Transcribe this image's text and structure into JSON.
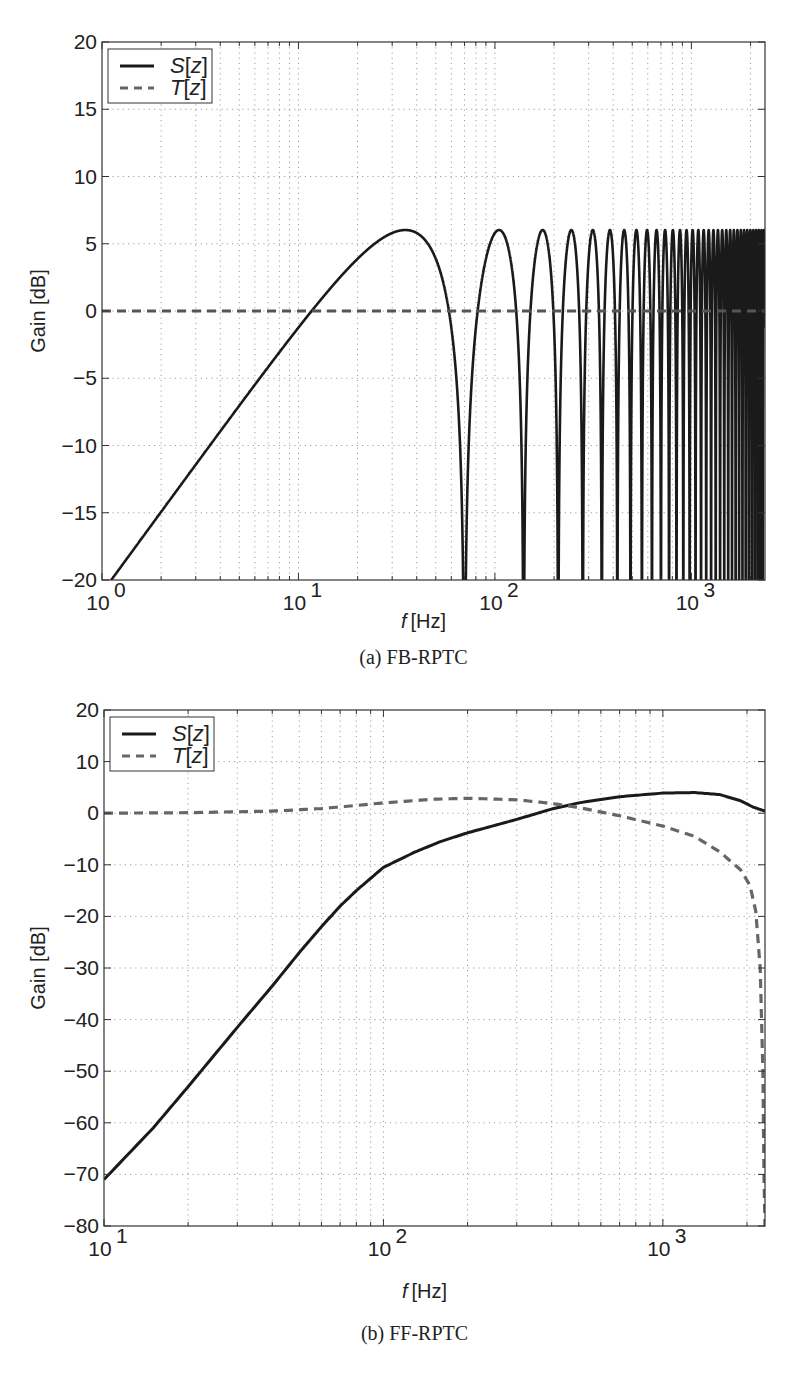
{
  "chart_data": [
    {
      "id": "a",
      "type": "line",
      "caption": "(a) FB-RPTC",
      "xlabel": "f [Hz]",
      "ylabel": "Gain [dB]",
      "xscale": "log",
      "xlim": [
        1,
        2370
      ],
      "ylim": [
        -20,
        20
      ],
      "xticks": [
        {
          "value": 1,
          "base": "10",
          "exp": "0"
        },
        {
          "value": 10,
          "base": "10",
          "exp": "1"
        },
        {
          "value": 100,
          "base": "10",
          "exp": "2"
        },
        {
          "value": 1000,
          "base": "10",
          "exp": "3"
        }
      ],
      "yticks": [
        20,
        15,
        10,
        5,
        0,
        -5,
        -10,
        -15,
        -20
      ],
      "grid": true,
      "legend": {
        "position": "upper-left",
        "entries": [
          {
            "label": "S[z]",
            "style": "solid"
          },
          {
            "label": "T[z]",
            "style": "dashed"
          }
        ]
      },
      "series": [
        {
          "name": "S[z]",
          "style": "solid",
          "color": "#1a1a1a",
          "description": "Comb-shaped sensitivity: |S| = 2|sin(pi f / f0)|, rising 20 dB/decade at low frequency, peaks of ~6 dB at odd multiples of f0/2, notches to -inf at multiples of f0",
          "comb_period_hz": 70,
          "peak_db": 6.02,
          "x": [
            1,
            2,
            5,
            10,
            11.5,
            20,
            35,
            50,
            60,
            70,
            105,
            140,
            175,
            210,
            245,
            280,
            1000,
            2370
          ],
          "y": [
            -20.0,
            -14.0,
            -6.1,
            -0.8,
            0.0,
            4.0,
            6.0,
            4.4,
            2.0,
            -20,
            6.0,
            -20,
            6.0,
            -20,
            6.0,
            -20,
            0.0,
            6.0
          ]
        },
        {
          "name": "T[z]",
          "style": "dashed",
          "color": "#555555",
          "x": [
            1,
            10,
            100,
            1000,
            2370
          ],
          "y": [
            0,
            0,
            0,
            0,
            0
          ]
        }
      ]
    },
    {
      "id": "b",
      "type": "line",
      "caption": "(b) FF-RPTC",
      "xlabel": "f [Hz]",
      "ylabel": "Gain [dB]",
      "xscale": "log",
      "xlim": [
        10,
        2320
      ],
      "ylim": [
        -80,
        20
      ],
      "xticks": [
        {
          "value": 10,
          "base": "10",
          "exp": "1"
        },
        {
          "value": 100,
          "base": "10",
          "exp": "2"
        },
        {
          "value": 1000,
          "base": "10",
          "exp": "3"
        }
      ],
      "yticks": [
        20,
        10,
        0,
        -10,
        -20,
        -30,
        -40,
        -50,
        -60,
        -70,
        -80
      ],
      "grid": true,
      "legend": {
        "position": "upper-left",
        "entries": [
          {
            "label": "S[z]",
            "style": "solid"
          },
          {
            "label": "T[z]",
            "style": "dashed"
          }
        ]
      },
      "series": [
        {
          "name": "S[z]",
          "style": "solid",
          "color": "#1a1a1a",
          "x": [
            10,
            15,
            20,
            30,
            40,
            50,
            60,
            70,
            80,
            100,
            130,
            160,
            200,
            300,
            400,
            500,
            700,
            1000,
            1300,
            1600,
            1900,
            2100,
            2320
          ],
          "y": [
            -71,
            -61,
            -53,
            -41.5,
            -33.5,
            -27,
            -22,
            -18,
            -15,
            -10.5,
            -7.5,
            -5.5,
            -3.8,
            -1.2,
            0.8,
            2.0,
            3.2,
            3.9,
            4.0,
            3.6,
            2.4,
            1.2,
            0.4
          ]
        },
        {
          "name": "T[z]",
          "style": "dashed",
          "color": "#666666",
          "x": [
            10,
            20,
            40,
            60,
            80,
            100,
            150,
            200,
            300,
            400,
            500,
            700,
            1000,
            1300,
            1600,
            1900,
            2050,
            2150,
            2230,
            2280,
            2300,
            2320
          ],
          "y": [
            0,
            0.1,
            0.4,
            0.9,
            1.5,
            2.0,
            2.7,
            2.9,
            2.6,
            1.9,
            1.1,
            -0.5,
            -2.5,
            -4.5,
            -7.5,
            -11,
            -14,
            -19,
            -30,
            -50,
            -70,
            -80
          ]
        }
      ]
    }
  ]
}
